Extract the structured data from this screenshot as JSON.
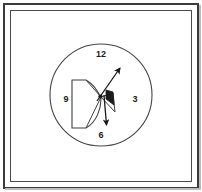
{
  "figure": {
    "background_color": "#ffffff",
    "stroke_color": "#3a3a3a",
    "fill_color": "#1b1b1b",
    "frame": {
      "outer_border_color": "#3a3a3a",
      "inner_border_color": "#4a4a4a"
    },
    "clock": {
      "center_x": 101,
      "center_y": 95,
      "radius": 51,
      "labels": [
        {
          "name": "twelve",
          "text": "12",
          "position": "top"
        },
        {
          "name": "three",
          "text": "3",
          "position": "right"
        },
        {
          "name": "six",
          "text": "6",
          "position": "bottom"
        },
        {
          "name": "nine",
          "text": "9",
          "position": "left"
        }
      ]
    },
    "arrows": [
      {
        "name": "upper-right-arrow",
        "label": "1-2 o'clock direction",
        "from_x": 99,
        "from_y": 99,
        "to_x": 122,
        "to_y": 66
      },
      {
        "name": "lower-left-arrow",
        "label": "5-6 o'clock direction",
        "from_x": 103,
        "from_y": 96,
        "to_x": 107,
        "to_y": 128
      }
    ],
    "shapes": {
      "cone_name": "d-shaped-cone",
      "wedge_name": "center-wedge",
      "marker_name": "center-filled-marker"
    }
  }
}
